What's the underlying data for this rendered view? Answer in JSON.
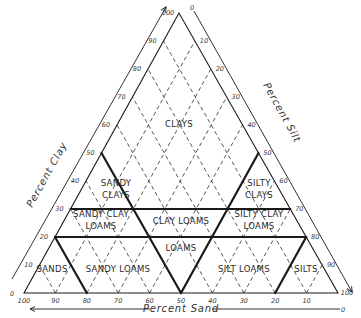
{
  "diagram": {
    "type": "soil-texture-triangle",
    "colors": {
      "ink": "#1a1a1a",
      "grid": "#444444",
      "background": "#ffffff"
    },
    "axes": {
      "clay": {
        "title": "Percent Clay",
        "ticks": [
          "10",
          "20",
          "30",
          "40",
          "50",
          "60",
          "70",
          "80",
          "90",
          "100"
        ],
        "zero_label": "0"
      },
      "silt": {
        "title": "Percent Silt",
        "ticks": [
          "10",
          "20",
          "30",
          "40",
          "50",
          "60",
          "70",
          "80",
          "90",
          "100"
        ],
        "zero_label": "0"
      },
      "sand": {
        "title": "Percent Sand",
        "ticks": [
          "100",
          "90",
          "80",
          "70",
          "60",
          "50",
          "40",
          "30",
          "20",
          "10"
        ],
        "zero_label": "0"
      }
    },
    "regions": [
      {
        "name": "CLAYS",
        "lines": [
          "CLAYS"
        ]
      },
      {
        "name": "SANDY CLAYS",
        "lines": [
          "SANDY",
          "CLAYS"
        ]
      },
      {
        "name": "SILTY CLAYS",
        "lines": [
          "SILTY",
          "CLAYS"
        ]
      },
      {
        "name": "SANDY CLAY LOAMS",
        "lines": [
          "SANDY CLAY",
          "LOAMS"
        ]
      },
      {
        "name": "CLAY LOAMS",
        "lines": [
          "CLAY LOAMS"
        ]
      },
      {
        "name": "SILTY CLAY LOAMS",
        "lines": [
          "SILTY CLAY",
          "LOAMS"
        ]
      },
      {
        "name": "LOAMS",
        "lines": [
          "LOAMS"
        ]
      },
      {
        "name": "SANDS",
        "lines": [
          "SANDS"
        ]
      },
      {
        "name": "SANDY LOAMS",
        "lines": [
          "SANDY LOAMS"
        ]
      },
      {
        "name": "SILT LOAMS",
        "lines": [
          "SILT LOAMS"
        ]
      },
      {
        "name": "SILTS",
        "lines": [
          "SILTS"
        ]
      }
    ],
    "boundaries": [
      {
        "desc": "clay 30 line",
        "from": [
          30,
          0
        ],
        "to": [
          30,
          70
        ]
      },
      {
        "desc": "clay 20 line",
        "from": [
          20,
          0
        ],
        "to": [
          20,
          80
        ]
      },
      {
        "desc": "sand 50 line",
        "from": [
          50,
          0
        ],
        "to": [
          0,
          50
        ]
      },
      {
        "desc": "silt 50 line",
        "from": [
          50,
          50
        ],
        "to": [
          0,
          50
        ]
      },
      {
        "desc": "sand 80 line",
        "from": [
          20,
          0
        ],
        "to": [
          0,
          20
        ]
      },
      {
        "desc": "silt 80 line",
        "from": [
          20,
          80
        ],
        "to": [
          0,
          80
        ]
      }
    ]
  }
}
